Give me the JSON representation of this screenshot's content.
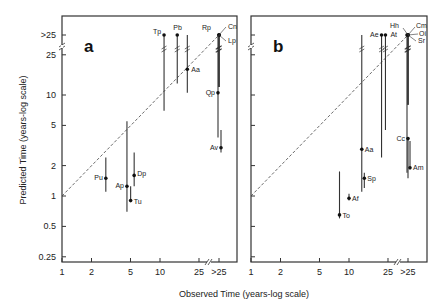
{
  "chart_data": {
    "type": "scatter",
    "subtype": "scatter with vertical range bars, log-log axes, identity reference line",
    "xlabel": "Observed Time (years-log scale)",
    "ylabel": "Predicted Time (years-log scale)",
    "x_ticks": [
      "1",
      "2",
      "5",
      "10",
      "25",
      ">25"
    ],
    "y_ticks": [
      "0.25",
      "0.5",
      "1",
      "2",
      "5",
      "10",
      "25",
      ">25"
    ],
    "xlim": [
      1,
      ">25"
    ],
    "ylim": [
      0.25,
      ">25"
    ],
    "axis_breaks": {
      "x": "between 25 and >25",
      "y": "between 25 and >25"
    },
    "reference_line": {
      "style": "dashed",
      "description": "y = x (1:1)"
    },
    "grid": false,
    "legend": null,
    "panels": [
      {
        "label": "a",
        "points": [
          {
            "name": "Pu",
            "x": 2.8,
            "y": 1.5,
            "y_low": 1.1,
            "y_high": 2.4
          },
          {
            "name": "Ap",
            "x": 4.6,
            "y": 1.25,
            "y_low": 0.7,
            "y_high": 5.5
          },
          {
            "name": "Dp",
            "x": 5.2,
            "y": 1.6,
            "y_low": 1.25,
            "y_high": 2.7
          },
          {
            "name": "Tu",
            "x": 4.9,
            "y": 0.9,
            "y_low": 0.9,
            "y_high": 1.25
          },
          {
            "name": "Tp",
            "x": 11,
            "y": ">25",
            "y_low": 7,
            "y_high": ">25"
          },
          {
            "name": "Pb",
            "x": 15,
            "y": ">25",
            "y_low": 13,
            "y_high": ">25"
          },
          {
            "name": "Aa",
            "x": 19,
            "y": 18,
            "y_low": 10.5,
            "y_high": ">25"
          },
          {
            "name": "Rp",
            "x": ">25",
            "y": ">25",
            "y_low": 12,
            "y_high": ">25"
          },
          {
            "name": "Cn",
            "x": ">25",
            "y": ">25",
            "y_low": 12,
            "y_high": ">25"
          },
          {
            "name": "Lp",
            "x": ">25",
            "y": ">25",
            "y_low": 12,
            "y_high": ">25"
          },
          {
            "name": "Qp",
            "x": ">25",
            "y": 10.5,
            "y_low": 3.8,
            "y_high": ">25"
          },
          {
            "name": "Av",
            "x": ">25",
            "y": 3.0,
            "y_low": 2.7,
            "y_high": 4.5
          }
        ]
      },
      {
        "label": "b",
        "points": [
          {
            "name": "To",
            "x": 8,
            "y": 0.65,
            "y_low": 0.6,
            "y_high": 1.75
          },
          {
            "name": "Af",
            "x": 10,
            "y": 0.95,
            "y_low": 0.9,
            "y_high": 1.05
          },
          {
            "name": "Aa",
            "x": 13.5,
            "y": 2.9,
            "y_low": 1.1,
            "y_high": ">25"
          },
          {
            "name": "Sp",
            "x": 14,
            "y": 1.5,
            "y_low": 1.2,
            "y_high": 1.7
          },
          {
            "name": "Ae",
            "x": 22,
            "y": ">25",
            "y_low": 2.4,
            "y_high": ">25"
          },
          {
            "name": "At",
            "x": 23,
            "y": ">25",
            "y_low": 4.5,
            "y_high": ">25"
          },
          {
            "name": "Hh",
            "x": ">25",
            "y": ">25",
            "y_low": 1.7,
            "y_high": ">25"
          },
          {
            "name": "Cm",
            "x": ">25",
            "y": ">25",
            "y_low": 8,
            "y_high": ">25"
          },
          {
            "name": "Oi",
            "x": ">25",
            "y": ">25",
            "y_low": 8,
            "y_high": ">25"
          },
          {
            "name": "Sr",
            "x": ">25",
            "y": ">25",
            "y_low": 8,
            "y_high": ">25"
          },
          {
            "name": "Cc",
            "x": ">25",
            "y": 3.7,
            "y_low": 1.5,
            "y_high": 3.7
          },
          {
            "name": "Am",
            "x": ">25",
            "y": 1.9,
            "y_low": 1.9,
            "y_high": 3.5
          }
        ]
      }
    ]
  },
  "figure": {
    "xlabel": "Observed Time (years-log scale)",
    "ylabel": "Predicted Time (years-log scale)",
    "panel_a_letter": "a",
    "panel_b_letter": "b"
  }
}
